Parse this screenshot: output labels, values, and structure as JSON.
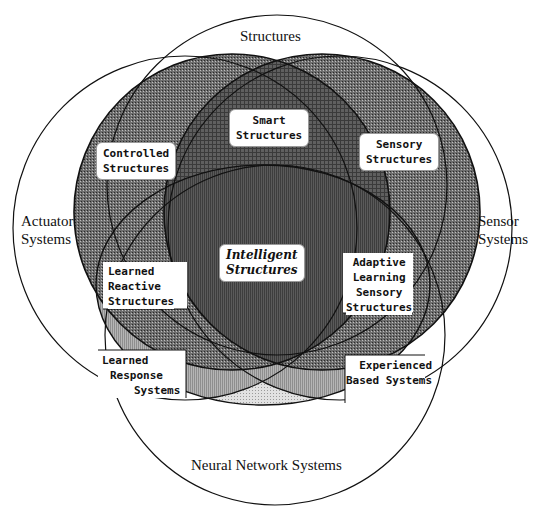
{
  "diagram": {
    "type": "venn",
    "outer_sets": {
      "top": "Structures",
      "left": [
        "Actuator",
        "Systems"
      ],
      "right": [
        "Sensor",
        "Systems"
      ],
      "bottom": "Neural Network Systems"
    },
    "regions": {
      "controlled": [
        "Controlled",
        "Structures"
      ],
      "sensory": [
        "Sensory",
        "Structures"
      ],
      "smart": [
        "Smart",
        "Structures"
      ],
      "intelligent": [
        "Intelligent",
        "Structures"
      ],
      "learned_reactive": [
        "Learned",
        "Reactive",
        "Structures"
      ],
      "adaptive": [
        "Adaptive",
        "Learning",
        "Sensory",
        "Structures"
      ],
      "learned_response": [
        "Learned",
        "Response",
        "Systems"
      ],
      "experienced": [
        "Experienced",
        "Based Systems"
      ]
    },
    "colors": {
      "outline": "#111111",
      "dark_fill": "#5a5a5a",
      "medium_fill": "#8a8a8a",
      "light_fill": "#c4c4c4",
      "lighter_fill": "#dcdcdc",
      "background": "#ffffff"
    }
  }
}
